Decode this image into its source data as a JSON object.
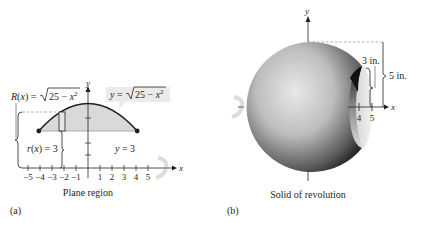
{
  "panel_a": {
    "label": "(a)",
    "caption": "Plane region",
    "axis_x": "x",
    "axis_y": "y",
    "x_ticks": [
      "−5",
      "−4",
      "−3",
      "−2",
      "−1",
      "1",
      "2",
      "3",
      "4",
      "5"
    ],
    "curve_label": "y = √(25 − x²)",
    "curve_label_parts": {
      "lhs": "y = ",
      "radicand": "25 − x",
      "exp": "2"
    },
    "outer_radius_label_parts": {
      "lhs": "R(x) = ",
      "radicand": "25 − x",
      "exp": "2"
    },
    "inner_radius_label": "r(x) = 3",
    "line_label": "y = 3",
    "region_color": "#d9d9d9",
    "curve_color": "#231f20"
  },
  "panel_b": {
    "label": "(b)",
    "caption": "Solid of revolution",
    "axis_x": "x",
    "axis_y": "y",
    "x_ticks": [
      "4",
      "5"
    ],
    "dim_inner": "3 in.",
    "dim_outer": "5 in."
  }
}
